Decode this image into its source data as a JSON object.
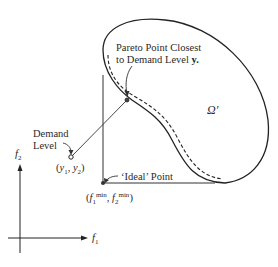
{
  "diagram": {
    "region_label": "Ω′",
    "pareto_label_line1": "Pareto Point Closest",
    "pareto_label_line2": "to Demand Level ",
    "pareto_label_bold": "y.",
    "demand_label_line1": "Demand",
    "demand_label_line2": "Level",
    "demand_coords": {
      "open": "(",
      "y1": "y",
      "sub1": "1",
      "sep": ", ",
      "y2": "y",
      "sub2": "2",
      "close": ")"
    },
    "ideal_label": "‘Ideal’ Point",
    "ideal_coords": {
      "open": "(",
      "f1": "f",
      "sub1": "1",
      "sup1": "min",
      "sep": ", ",
      "f2": "f",
      "sub2": "2",
      "sup2": "min",
      "close": ")"
    },
    "axis_x": {
      "f": "f",
      "sub": "1"
    },
    "axis_y": {
      "f": "f",
      "sub": "2"
    }
  }
}
